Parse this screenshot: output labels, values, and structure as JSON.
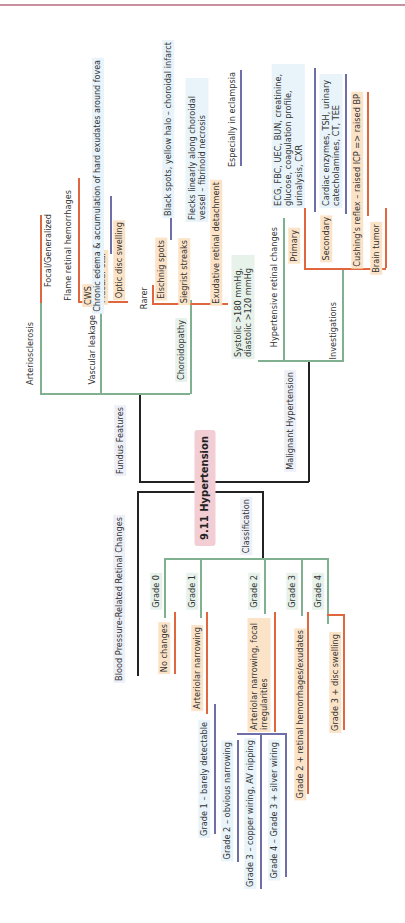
{
  "title": "9.11 Hypertension",
  "branches": {
    "fundus": {
      "label": "Fundus Features",
      "arteriosclerosis": {
        "label": "Arteriosclerosis",
        "children": [
          "Focal/Generalized"
        ]
      },
      "vascular_leakage": {
        "label": "Vascular leakage",
        "children": [
          "Flame retinal hemorrhages",
          "CWS",
          "Macular star",
          "Optic disc swelling"
        ],
        "macular_star_note": "Chronic edema & accumulation of hard exudates around fovea"
      },
      "choroidopathy": {
        "label": "Choroidopathy",
        "rarer": "Rarer",
        "elschnig": "Elschnig spots",
        "elschnig_note": "Black spots, yellow halo – choroidal infarct",
        "siegrist": "Siegrist streaks",
        "siegrist_note": "Flecks linearly along choroidal vessel – fibrinoid necrosis",
        "exudative": "Exudative retinal detachment",
        "exudative_note": "Especially in eclampsia"
      }
    },
    "malignant": {
      "label": "Malignant Hypertension",
      "criteria": "Systolic >180 mmHg, diastolic >120 mmHg",
      "retinal": "Hypertensive retinal changes",
      "investigations": {
        "label": "Investigations",
        "primary": "Primary",
        "primary_note": "ECG, FBC, UEC, BUN, creatinine, glucose, coagulation profile, urinalysis, CXR",
        "secondary": "Secondary",
        "secondary_note": "Cardiac enzymes, TSH, urinary catecholamines, CT, TEE",
        "cushing": "Cushing's reflex – raised ICP => raised BP",
        "brain_tumor": "Brain tumor"
      }
    },
    "bp_changes": {
      "label": "Blood Pressure-Related Retinal Changes",
      "grades": [
        "Grade 1 – barely detectable",
        "Grade 2 – obvious narrowing",
        "Grade 3 – copper wiring, AV nipping",
        "Grade 4 – Grade 3 + silver wiring"
      ]
    },
    "classification": {
      "label": "Classification",
      "grades": [
        {
          "label": "Grade 0",
          "desc": "No changes"
        },
        {
          "label": "Grade 1",
          "desc": "Arteriolar narrowing"
        },
        {
          "label": "Grade 2",
          "desc": "Arteriolar narrowing, focal irregularities"
        },
        {
          "label": "Grade 3",
          "desc": "Grade 2 + retinal hemorrhages/exudates"
        },
        {
          "label": "Grade 4",
          "desc": "Grade 3 + disc swelling"
        }
      ]
    }
  },
  "colors": {
    "level1": "#7fb08f",
    "level2": "#e0673d",
    "level3": "#6e6fa8",
    "trunk": "#222222",
    "center": "#f2cdd4"
  }
}
